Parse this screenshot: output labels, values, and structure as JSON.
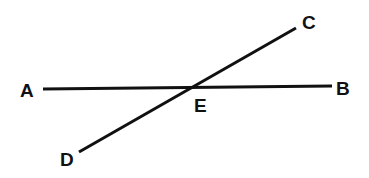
{
  "diagram": {
    "type": "intersecting-lines",
    "colors": {
      "line": "#111111",
      "background": "#ffffff"
    },
    "points": [
      {
        "id": "A",
        "label": "A",
        "x": 43,
        "y": 89,
        "label_x": 20,
        "label_y": 97
      },
      {
        "id": "B",
        "label": "B",
        "x": 332,
        "y": 86,
        "label_x": 336,
        "label_y": 95
      },
      {
        "id": "C",
        "label": "C",
        "x": 296,
        "y": 28,
        "label_x": 302,
        "label_y": 29
      },
      {
        "id": "D",
        "label": "D",
        "x": 79,
        "y": 152,
        "label_x": 60,
        "label_y": 166
      },
      {
        "id": "E",
        "label": "E",
        "x": 192,
        "y": 88,
        "label_x": 194,
        "label_y": 112
      }
    ],
    "segments": [
      {
        "id": "AB",
        "from": "A",
        "to": "B"
      },
      {
        "id": "DC",
        "from": "D",
        "to": "C"
      }
    ],
    "intersection": "E"
  }
}
